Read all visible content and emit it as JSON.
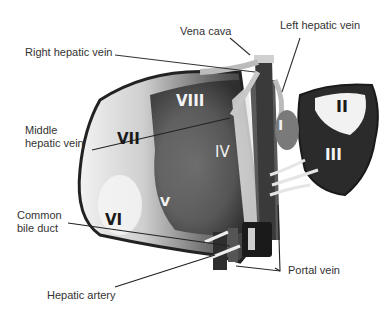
{
  "diagram": {
    "labels": {
      "vena_cava": "Vena cava",
      "left_hepatic_vein": "Left hepatic vein",
      "right_hepatic_vein": "Right hepatic vein",
      "middle_hepatic_vein": "Middle\nhepatic vein",
      "common_bile_duct": "Common\nbile duct",
      "hepatic_artery": "Hepatic artery",
      "portal_vein": "Portal vein"
    },
    "segments": {
      "I": "I",
      "II": "II",
      "III": "III",
      "IV": "IV",
      "V": "V",
      "VI": "VI",
      "VII": "VII",
      "VIII": "VIII"
    }
  }
}
